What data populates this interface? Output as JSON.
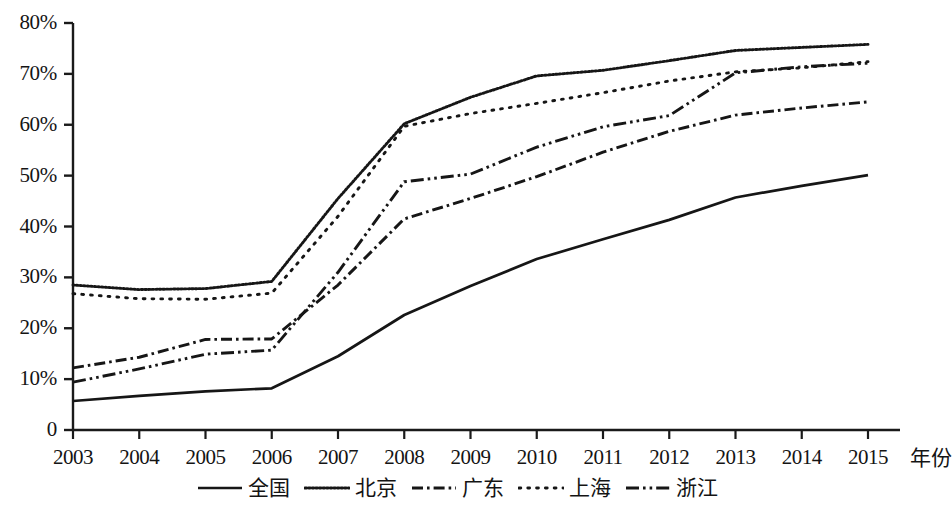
{
  "chart_data": {
    "type": "line",
    "title": "",
    "subtitle": "",
    "xlabel": "年份",
    "ylabel": "",
    "x": [
      2003,
      2004,
      2005,
      2006,
      2007,
      2008,
      2009,
      2010,
      2011,
      2012,
      2013,
      2014,
      2015
    ],
    "categories": [
      "2003",
      "2004",
      "2005",
      "2006",
      "2007",
      "2008",
      "2009",
      "2010",
      "2011",
      "2012",
      "2013",
      "2014",
      "2015"
    ],
    "xtick_labels": [
      "2003",
      "2004",
      "2005",
      "2006",
      "2007",
      "2008",
      "2009",
      "2010",
      "2011",
      "2012",
      "2013",
      "2014",
      "2015"
    ],
    "ytick_labels": [
      "0",
      "10%",
      "20%",
      "30%",
      "40%",
      "50%",
      "60%",
      "70%",
      "80%"
    ],
    "ytick_values": [
      0,
      10,
      20,
      30,
      40,
      50,
      60,
      70,
      80
    ],
    "ylim": [
      0,
      80
    ],
    "xlim": [
      2003,
      2015
    ],
    "grid": false,
    "legend_position": "bottom",
    "units": "percent",
    "series": [
      {
        "name": "全国",
        "style": "solid",
        "color": "#161616",
        "values": [
          5.7,
          6.7,
          7.6,
          8.2,
          14.5,
          22.6,
          28.3,
          33.6,
          37.5,
          41.3,
          45.7,
          48.0,
          50.1
        ]
      },
      {
        "name": "北京",
        "style": "fine-dotted",
        "color": "#161616",
        "values": [
          28.5,
          27.6,
          27.8,
          29.2,
          45.5,
          60.2,
          65.4,
          69.6,
          70.7,
          72.6,
          74.6,
          75.2,
          75.8
        ]
      },
      {
        "name": "广东",
        "style": "dash-dot",
        "color": "#161616",
        "values": [
          12.2,
          14.3,
          17.8,
          17.9,
          28.5,
          41.5,
          45.5,
          49.8,
          54.6,
          58.7,
          61.9,
          63.3,
          64.5
        ]
      },
      {
        "name": "上海",
        "style": "sparse-dotted",
        "color": "#161616",
        "values": [
          26.8,
          25.8,
          25.7,
          26.9,
          42.0,
          59.7,
          62.2,
          64.2,
          66.3,
          68.6,
          70.4,
          71.2,
          72.4
        ]
      },
      {
        "name": "浙江",
        "style": "dash-dot-dot",
        "color": "#161616",
        "values": [
          9.4,
          12.0,
          14.9,
          15.7,
          31.0,
          48.8,
          50.3,
          55.6,
          59.6,
          61.8,
          70.2,
          71.4,
          72.1
        ]
      }
    ]
  },
  "axes": {
    "y_ticks": [
      "80%",
      "70%",
      "60%",
      "50%",
      "40%",
      "30%",
      "20%",
      "10%",
      "0"
    ],
    "x_ticks": [
      "2003",
      "2004",
      "2005",
      "2006",
      "2007",
      "2008",
      "2009",
      "2010",
      "2011",
      "2012",
      "2013",
      "2014",
      "2015"
    ],
    "x_axis_title": "年份"
  },
  "legend": {
    "items": [
      {
        "label": "全国",
        "style": "solid"
      },
      {
        "label": "北京",
        "style": "fine-dotted"
      },
      {
        "label": "广东",
        "style": "dash-dot"
      },
      {
        "label": "上海",
        "style": "sparse-dotted"
      },
      {
        "label": "浙江",
        "style": "dash-dot-dot"
      }
    ]
  }
}
